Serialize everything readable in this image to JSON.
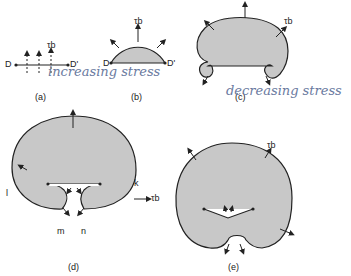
{
  "figure": {
    "panels": [
      {
        "id": "a",
        "caption": "(a)",
        "labels": {
          "left": "D",
          "right": "D'",
          "stress": "τb"
        }
      },
      {
        "id": "b",
        "caption": "(b)",
        "labels": {
          "left": "D",
          "right": "D'",
          "stress": "τb"
        }
      },
      {
        "id": "c",
        "caption": "(c)",
        "labels": {
          "stress": "τb"
        }
      },
      {
        "id": "d",
        "caption": "(d)",
        "labels": {
          "l": "l",
          "k": "k",
          "m": "m",
          "n": "n",
          "stress": "τb"
        }
      },
      {
        "id": "e",
        "caption": "(e)",
        "labels": {
          "stress": "τb"
        }
      }
    ],
    "annotations": {
      "increasing": "increasing stress",
      "decreasing": "decreasing stress"
    },
    "colors": {
      "fill": "#c8c8c8",
      "stroke": "#222222",
      "handwriting": "#6a7aa0"
    }
  }
}
